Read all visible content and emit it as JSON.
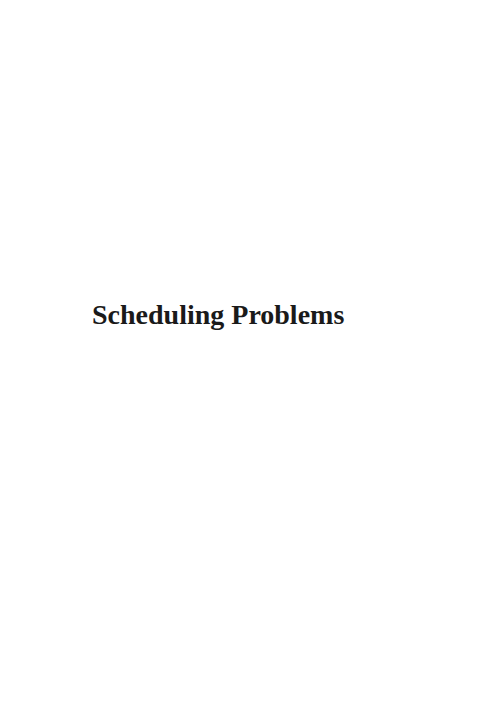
{
  "page": {
    "title": "Scheduling Problems"
  },
  "colors": {
    "background": "#ffffff",
    "text": "#1a1a1a"
  }
}
